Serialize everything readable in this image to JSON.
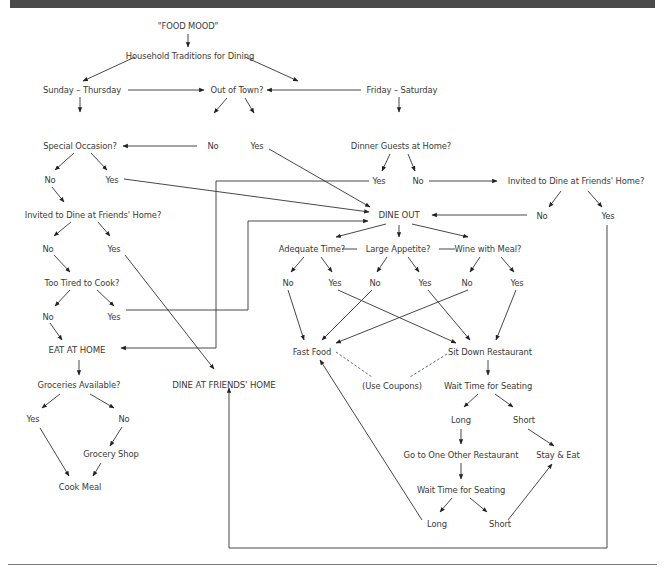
{
  "header_bar": {
    "color": "#4a4a4a"
  },
  "diagram": {
    "title": "\"FOOD MOOD\"",
    "nodes": {
      "root": "\"FOOD MOOD\"",
      "traditions": "Household Traditions for Dining",
      "sun_thu": "Sunday – Thursday",
      "fri_sat": "Friday – Saturday",
      "out_of_town": "Out of Town?",
      "oot_no": "No",
      "oot_yes": "Yes",
      "special_occasion": "Special Occasion?",
      "so_no": "No",
      "so_yes": "Yes",
      "invited_left": "Invited to Dine at Friends' Home?",
      "inv_l_no": "No",
      "inv_l_yes": "Yes",
      "too_tired": "Too Tired to Cook?",
      "tt_no": "No",
      "tt_yes": "Yes",
      "eat_at_home": "EAT AT HOME",
      "groceries": "Groceries Available?",
      "gr_yes": "Yes",
      "gr_no": "No",
      "grocery_shop": "Grocery Shop",
      "cook_meal": "Cook Meal",
      "dine_friends": "DINE AT FRIENDS' HOME",
      "dinner_guests": "Dinner Guests at Home?",
      "dg_yes": "Yes",
      "dg_no": "No",
      "invited_right": "Invited to Dine at Friends' Home?",
      "inv_r_no": "No",
      "inv_r_yes": "Yes",
      "dine_out": "DINE OUT",
      "adequate_time": "Adequate Time?",
      "large_appetite": "Large Appetite?",
      "wine": "Wine with Meal?",
      "at_no": "No",
      "at_yes": "Yes",
      "la_no": "No",
      "la_yes": "Yes",
      "wm_no": "No",
      "wm_yes": "Yes",
      "fast_food": "Fast Food",
      "sit_down": "Sit Down Restaurant",
      "coupons": "(Use Coupons)",
      "wait1": "Wait Time for Seating",
      "w1_long": "Long",
      "w1_short": "Short",
      "go_other": "Go to One Other Restaurant",
      "stay_eat": "Stay & Eat",
      "wait2": "Wait Time for Seating",
      "w2_long": "Long",
      "w2_short": "Short"
    }
  }
}
